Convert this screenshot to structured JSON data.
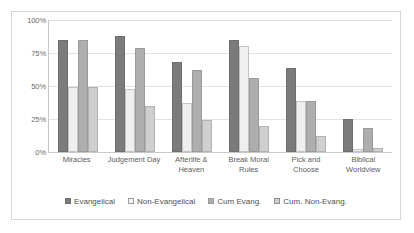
{
  "chart_data": {
    "type": "bar",
    "title": "",
    "subtitle": "",
    "xlabel": "",
    "ylabel": "",
    "ylim": [
      0,
      100
    ],
    "y_ticks": [
      "0%",
      "25%",
      "50%",
      "75%",
      "100%"
    ],
    "y_tick_values": [
      0,
      25,
      50,
      75,
      100
    ],
    "grid": "horizontal",
    "legend_position": "bottom",
    "categories": [
      "Miracles",
      "Judgement Day",
      "Afterlife & Heaven",
      "Break Moral Rules",
      "Pick and Choose",
      "Biblical Worldview"
    ],
    "series": [
      {
        "name": "Evangelical",
        "color": "#7b7b7b",
        "values": [
          85,
          88,
          68,
          85,
          64,
          25
        ]
      },
      {
        "name": "Non-Evangelical",
        "color": "#efefef",
        "values": [
          49,
          48,
          37,
          80,
          39,
          2
        ]
      },
      {
        "name": "Cum Evang.",
        "color": "#aeaeae",
        "values": [
          85,
          79,
          62,
          56,
          39,
          18
        ]
      },
      {
        "name": "Cum. Non-Evang.",
        "color": "#cfcfcf",
        "values": [
          49,
          35,
          24,
          20,
          12,
          3
        ]
      }
    ]
  }
}
